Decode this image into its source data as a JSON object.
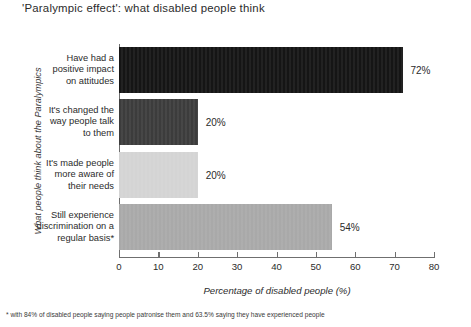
{
  "chart_data": {
    "type": "bar",
    "orientation": "horizontal",
    "title": "'Paralympic effect': what disabled people think",
    "xlabel": "Percentage of disabled people (%)",
    "ylabel": "What people think about the Paralympics",
    "xlim": [
      0,
      80
    ],
    "xticks": [
      0,
      10,
      20,
      30,
      40,
      50,
      60,
      70,
      80
    ],
    "grid": false,
    "legend": "none",
    "categories": [
      "Have had a\npositive impact\non attitudes",
      "It's changed the\nway people talk\nto them",
      "It's made people\nmore aware of\ntheir needs",
      "Still experience\ndiscrimination on a\nregular basis*"
    ],
    "values": [
      72,
      20,
      20,
      54
    ],
    "value_labels": [
      "72%",
      "20%",
      "20%",
      "54%"
    ],
    "bar_colors": [
      "#151515",
      "#3c3c3c",
      "#d4d4d4",
      "#a9a9a9"
    ],
    "footnote": "* with 84% of disabled people saying people patronise them and 63.5% saying they have experienced people"
  },
  "categories_display": [
    [
      "Have had a",
      "positive impact",
      "on attitudes"
    ],
    [
      "It's changed the",
      "way people talk",
      "to them"
    ],
    [
      "It's made people",
      "more aware of",
      "their needs"
    ],
    [
      "Still experience",
      "discrimination on a",
      "regular basis*"
    ]
  ],
  "tick_labels": [
    "0",
    "10",
    "20",
    "30",
    "40",
    "50",
    "60",
    "70",
    "80"
  ]
}
